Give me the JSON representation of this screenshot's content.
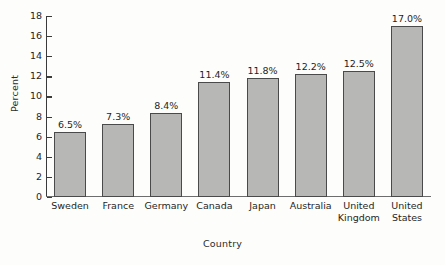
{
  "chart_data": {
    "type": "bar",
    "title": "",
    "xlabel": "Country",
    "ylabel": "Percent",
    "categories": [
      "Sweden",
      "France",
      "Germany",
      "Canada",
      "Japan",
      "Australia",
      "United Kingdom",
      "United States"
    ],
    "values": [
      6.5,
      7.3,
      8.4,
      11.4,
      11.8,
      12.2,
      12.5,
      17.0
    ],
    "data_labels": [
      "6.5%",
      "7.3%",
      "8.4%",
      "11.4%",
      "11.8%",
      "12.2%",
      "12.5%",
      "17.0%"
    ],
    "ylim": [
      0,
      18
    ],
    "ytick_values": [
      0,
      2,
      4,
      6,
      8,
      10,
      12,
      14,
      16,
      18
    ],
    "ytick_labels": [
      "0",
      "2",
      "4",
      "6",
      "8",
      "10",
      "12",
      "14",
      "16",
      "18"
    ],
    "grid": false,
    "legend": null,
    "bar_fill_color": "#b7b7b5",
    "bar_border_color": "#4a4a4a",
    "axis_color": "#3a3a3a",
    "background_color": "#fdfdfb"
  },
  "axis": {
    "y_title": "Percent",
    "x_title": "Country"
  },
  "category_label_lines": [
    {
      "line1": "Sweden",
      "line2": ""
    },
    {
      "line1": "France",
      "line2": ""
    },
    {
      "line1": "Germany",
      "line2": ""
    },
    {
      "line1": "Canada",
      "line2": ""
    },
    {
      "line1": "Japan",
      "line2": ""
    },
    {
      "line1": "Australia",
      "line2": ""
    },
    {
      "line1": "United",
      "line2": "Kingdom"
    },
    {
      "line1": "United",
      "line2": "States"
    }
  ]
}
